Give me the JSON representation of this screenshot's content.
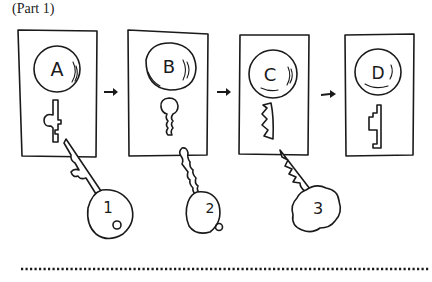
{
  "title": "(Part 1)",
  "panels": [
    {
      "lock_label": "A",
      "keyhole_shape": "cross-notched"
    },
    {
      "lock_label": "B",
      "keyhole_shape": "rounded-wavy"
    },
    {
      "lock_label": "C",
      "keyhole_shape": "zigzag"
    },
    {
      "lock_label": "D",
      "keyhole_shape": "stepped"
    }
  ],
  "keys": [
    {
      "label": "1",
      "fits_panel": "A"
    },
    {
      "label": "2",
      "fits_panel": "B"
    },
    {
      "label": "3",
      "fits_panel": "C"
    }
  ],
  "arrows": [
    {
      "from": "A",
      "to": "B",
      "icon": "right-arrow-icon"
    },
    {
      "from": "B",
      "to": "C",
      "icon": "right-arrow-icon"
    },
    {
      "from": "C",
      "to": "D",
      "icon": "right-arrow-icon"
    }
  ],
  "divider": {
    "style": "dotted"
  }
}
